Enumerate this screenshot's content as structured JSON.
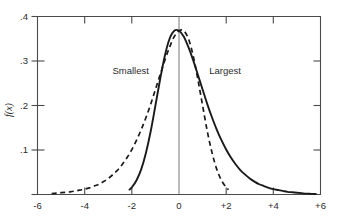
{
  "chart_data": {
    "type": "line",
    "title": "",
    "xlabel": "",
    "ylabel": "f(x)",
    "xlim": [
      -6,
      6
    ],
    "ylim": [
      0,
      0.4
    ],
    "grid": false,
    "legend_position": "inline-annotations",
    "x_ticks": [
      "-6",
      "-4",
      "-2",
      "0",
      "+2",
      "+4",
      "+6"
    ],
    "x_tick_values": [
      -6,
      -4,
      -2,
      0,
      2,
      4,
      6
    ],
    "y_ticks": [
      ".1",
      ".2",
      ".3",
      ".4"
    ],
    "y_tick_values": [
      0.1,
      0.2,
      0.3,
      0.4
    ],
    "annotations": [
      {
        "text": "Smallest",
        "x": -2.05,
        "y": 0.272
      },
      {
        "text": "Largest",
        "x": 1.95,
        "y": 0.272
      }
    ],
    "series": [
      {
        "name": "Smallest",
        "style": "dashed",
        "x": [
          -5.4,
          -5.2,
          -5.0,
          -4.8,
          -4.6,
          -4.4,
          -4.2,
          -4.0,
          -3.8,
          -3.6,
          -3.4,
          -3.2,
          -3.0,
          -2.8,
          -2.6,
          -2.4,
          -2.2,
          -2.0,
          -1.8,
          -1.6,
          -1.4,
          -1.2,
          -1.0,
          -0.8,
          -0.6,
          -0.4,
          -0.2,
          0.0,
          0.2,
          0.4,
          0.6,
          0.8,
          1.0,
          1.2,
          1.4,
          1.6,
          1.8,
          2.0,
          2.1
        ],
        "y": [
          0.002,
          0.003,
          0.004,
          0.005,
          0.006,
          0.008,
          0.01,
          0.012,
          0.015,
          0.019,
          0.023,
          0.029,
          0.036,
          0.045,
          0.055,
          0.068,
          0.083,
          0.101,
          0.122,
          0.146,
          0.173,
          0.203,
          0.236,
          0.269,
          0.302,
          0.331,
          0.355,
          0.368,
          0.368,
          0.35,
          0.312,
          0.259,
          0.2,
          0.142,
          0.094,
          0.057,
          0.032,
          0.016,
          0.011
        ]
      },
      {
        "name": "Largest",
        "style": "solid",
        "x": [
          -2.1,
          -2.0,
          -1.8,
          -1.6,
          -1.4,
          -1.2,
          -1.0,
          -0.8,
          -0.6,
          -0.4,
          -0.2,
          0.0,
          0.2,
          0.4,
          0.6,
          0.8,
          1.0,
          1.2,
          1.4,
          1.6,
          1.8,
          2.0,
          2.2,
          2.4,
          2.6,
          2.8,
          3.0,
          3.2,
          3.4,
          3.6,
          3.8,
          4.0,
          4.2,
          4.4,
          4.6,
          4.8,
          5.0,
          5.2,
          5.4,
          5.6,
          5.8
        ],
        "y": [
          0.011,
          0.016,
          0.032,
          0.057,
          0.094,
          0.142,
          0.2,
          0.259,
          0.312,
          0.35,
          0.368,
          0.368,
          0.355,
          0.331,
          0.302,
          0.269,
          0.236,
          0.203,
          0.173,
          0.146,
          0.122,
          0.101,
          0.083,
          0.068,
          0.055,
          0.045,
          0.036,
          0.029,
          0.023,
          0.019,
          0.015,
          0.012,
          0.01,
          0.008,
          0.006,
          0.005,
          0.004,
          0.003,
          0.002,
          0.0015,
          0.001
        ]
      }
    ],
    "colors": {
      "curve": "#1a1a1a",
      "axis": "#4a4a4a",
      "background": "#ffffff"
    }
  }
}
